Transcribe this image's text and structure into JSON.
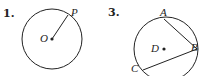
{
  "figures": [
    {
      "number": "1.",
      "circle": {
        "cx": 52,
        "cy": 39,
        "r": 30
      },
      "center_label": "O",
      "points": [
        {
          "label": "P",
          "x": 72,
          "y": 17
        }
      ],
      "segments": [
        [
          "O",
          "P"
        ]
      ]
    },
    {
      "number": "3.",
      "circle": {
        "cx": 166,
        "cy": 49,
        "r": 32
      },
      "center_label": "D",
      "points": [
        {
          "label": "A",
          "x": 164,
          "y": 18
        },
        {
          "label": "B",
          "x": 191,
          "y": 48
        },
        {
          "label": "C",
          "x": 143,
          "y": 68
        }
      ],
      "segments": [
        [
          "A",
          "B"
        ],
        [
          "B",
          "C"
        ]
      ]
    }
  ],
  "colors": {
    "stroke": "#222222",
    "background": "#ffffff"
  }
}
